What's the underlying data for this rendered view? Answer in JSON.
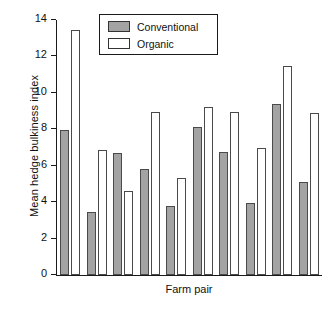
{
  "chart_data": {
    "type": "bar",
    "title": "",
    "xlabel": "Farm pair",
    "ylabel": "Mean hedge bulkiness index",
    "ylim": [
      0,
      14
    ],
    "yticks": [
      0,
      2,
      4,
      6,
      8,
      10,
      12,
      14
    ],
    "ytick_labels": [
      "0",
      "2",
      "4",
      "6",
      "8",
      "10",
      "12",
      "14"
    ],
    "grid": false,
    "legend_position": "top-center",
    "categories": [
      "1",
      "2",
      "3",
      "4",
      "5",
      "6",
      "7",
      "8",
      "9",
      "10"
    ],
    "series": [
      {
        "name": "Conventional",
        "color": "#a3a3a3",
        "values": [
          7.95,
          3.45,
          6.7,
          5.8,
          3.8,
          8.15,
          6.75,
          3.95,
          9.4,
          5.1
        ]
      },
      {
        "name": "Organic",
        "color": "#ffffff",
        "values": [
          13.45,
          6.85,
          4.6,
          8.95,
          5.35,
          9.2,
          8.95,
          6.95,
          11.5,
          8.9
        ]
      }
    ]
  },
  "legend": {
    "items": [
      {
        "label": "Conventional",
        "swatch": "conventional"
      },
      {
        "label": "Organic",
        "swatch": "organic"
      }
    ]
  }
}
